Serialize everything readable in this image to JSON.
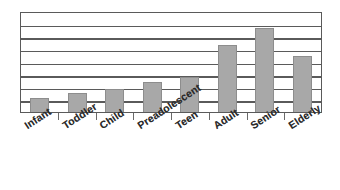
{
  "chart_data": {
    "type": "bar",
    "title": "",
    "subtitle": "",
    "xlabel": "",
    "ylabel": "",
    "categories": [
      "Infant",
      "Toddler",
      "Child",
      "Preadolescent",
      "Teen",
      "Adult",
      "Senior",
      "Elderly"
    ],
    "values": [
      1,
      1.35,
      1.6,
      2.05,
      2.45,
      4.65,
      5.85,
      3.9
    ],
    "ylim": [
      0,
      7
    ],
    "yticks": [
      0,
      1,
      2,
      3,
      4,
      5,
      6,
      7
    ],
    "ytick_labels": [
      "",
      "",
      "",
      "",
      "",
      "",
      "",
      ""
    ],
    "grid": true,
    "gridlines_count": 7,
    "legend": null,
    "legend_position": "none",
    "bar_color": "#a8a8a8",
    "bar_edge_color": "#8d8d8d",
    "axis_color": "#5a5a5a",
    "background_color": "#ffffff",
    "label_rotation_degrees": -33,
    "bars": [
      {
        "category": "Infant",
        "value": 1,
        "pixel_top": 94,
        "pixel_height": 19
      },
      {
        "category": "Toddler",
        "value": 1.35,
        "pixel_top": 99,
        "pixel_height": 14
      },
      {
        "category": "Child",
        "value": 1.6,
        "pixel_top": 96,
        "pixel_height": 17
      },
      {
        "category": "Preadolescent",
        "value": 2.05,
        "pixel_top": 91,
        "pixel_height": 22
      },
      {
        "category": "Teen",
        "value": 2.45,
        "pixel_top": 78,
        "pixel_height": 35
      },
      {
        "category": "Adult",
        "value": 4.65,
        "pixel_top": 46,
        "pixel_height": 67
      },
      {
        "category": "Senior",
        "value": 5.85,
        "pixel_top": 28,
        "pixel_height": 85
      },
      {
        "category": "Elderly",
        "value": 3.9,
        "pixel_top": 57,
        "pixel_height": 56
      }
    ]
  },
  "figure": {
    "width_px": 340,
    "height_px": 190,
    "plot_left_px": 20,
    "plot_top_px": 12,
    "plot_width_px": 302,
    "plot_height_px": 101
  }
}
